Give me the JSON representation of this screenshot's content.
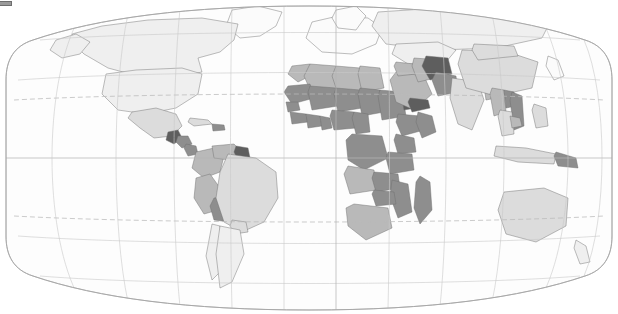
{
  "legend": {
    "swatch_color": "#9a9a9a",
    "label": "00",
    "label_note": "cropped numeric legend label at left edge"
  },
  "map": {
    "title": "",
    "projection": "robinson",
    "background_color": "#fdfdfd",
    "border_color": "#6d6d6d",
    "graticule": {
      "visible": true,
      "line_color": "#c9c9c9",
      "tropic_line_color": "#b9b9b9",
      "tropic_line_style": "dashed",
      "parallels": [
        "60N",
        "30N",
        "Tropic of Cancer",
        "Equator",
        "Tropic of Capricorn",
        "30S",
        "60S"
      ],
      "meridians": [
        "150W",
        "120W",
        "90W",
        "60W",
        "30W",
        "0",
        "30E",
        "60E",
        "90E",
        "120E",
        "150E"
      ]
    },
    "shade_scale": {
      "type": "sequential-grey",
      "levels": [
        {
          "name": "no-data",
          "color": "#fbfbfb"
        },
        {
          "name": "lowest",
          "color": "#efefef"
        },
        {
          "name": "low",
          "color": "#dcdcdc"
        },
        {
          "name": "medium",
          "color": "#b9b9b9"
        },
        {
          "name": "high",
          "color": "#8e8e8e"
        },
        {
          "name": "highest",
          "color": "#5e5e5e"
        }
      ]
    },
    "regions": [
      {
        "name": "canada",
        "level": "lowest"
      },
      {
        "name": "united-states",
        "level": "lowest"
      },
      {
        "name": "greenland",
        "level": "no-data"
      },
      {
        "name": "mexico",
        "level": "low"
      },
      {
        "name": "guatemala",
        "level": "highest"
      },
      {
        "name": "honduras",
        "level": "high"
      },
      {
        "name": "nicaragua",
        "level": "high"
      },
      {
        "name": "cuba",
        "level": "low"
      },
      {
        "name": "hispaniola",
        "level": "high"
      },
      {
        "name": "colombia",
        "level": "medium"
      },
      {
        "name": "venezuela",
        "level": "medium"
      },
      {
        "name": "guyana",
        "level": "highest"
      },
      {
        "name": "peru",
        "level": "medium"
      },
      {
        "name": "bolivia",
        "level": "high"
      },
      {
        "name": "brazil",
        "level": "low"
      },
      {
        "name": "paraguay",
        "level": "low"
      },
      {
        "name": "chile",
        "level": "lowest"
      },
      {
        "name": "argentina",
        "level": "lowest"
      },
      {
        "name": "europe",
        "level": "no-data"
      },
      {
        "name": "morocco",
        "level": "medium"
      },
      {
        "name": "algeria",
        "level": "medium"
      },
      {
        "name": "libya",
        "level": "medium"
      },
      {
        "name": "egypt",
        "level": "medium"
      },
      {
        "name": "mauritania",
        "level": "high"
      },
      {
        "name": "mali",
        "level": "high"
      },
      {
        "name": "niger",
        "level": "high"
      },
      {
        "name": "chad",
        "level": "high"
      },
      {
        "name": "sudan",
        "level": "high"
      },
      {
        "name": "eritrea",
        "level": "highest"
      },
      {
        "name": "ethiopia",
        "level": "high"
      },
      {
        "name": "somalia",
        "level": "high"
      },
      {
        "name": "senegal",
        "level": "high"
      },
      {
        "name": "guinea",
        "level": "high"
      },
      {
        "name": "ivory-coast",
        "level": "high"
      },
      {
        "name": "ghana",
        "level": "high"
      },
      {
        "name": "nigeria",
        "level": "high"
      },
      {
        "name": "cameroon",
        "level": "high"
      },
      {
        "name": "dr-congo",
        "level": "high"
      },
      {
        "name": "kenya",
        "level": "high"
      },
      {
        "name": "tanzania",
        "level": "high"
      },
      {
        "name": "angola",
        "level": "medium"
      },
      {
        "name": "zambia",
        "level": "high"
      },
      {
        "name": "mozambique",
        "level": "high"
      },
      {
        "name": "madagascar",
        "level": "high"
      },
      {
        "name": "zimbabwe",
        "level": "high"
      },
      {
        "name": "south-africa",
        "level": "medium"
      },
      {
        "name": "saudi-arabia",
        "level": "medium"
      },
      {
        "name": "yemen",
        "level": "highest"
      },
      {
        "name": "iraq",
        "level": "medium"
      },
      {
        "name": "iran",
        "level": "medium"
      },
      {
        "name": "afghanistan",
        "level": "highest"
      },
      {
        "name": "pakistan",
        "level": "high"
      },
      {
        "name": "india",
        "level": "low"
      },
      {
        "name": "nepal",
        "level": "medium"
      },
      {
        "name": "bangladesh",
        "level": "medium"
      },
      {
        "name": "china",
        "level": "low"
      },
      {
        "name": "mongolia",
        "level": "low"
      },
      {
        "name": "russia",
        "level": "lowest"
      },
      {
        "name": "kazakhstan",
        "level": "lowest"
      },
      {
        "name": "myanmar",
        "level": "medium"
      },
      {
        "name": "laos",
        "level": "high"
      },
      {
        "name": "vietnam",
        "level": "high"
      },
      {
        "name": "thailand",
        "level": "low"
      },
      {
        "name": "cambodia",
        "level": "medium"
      },
      {
        "name": "philippines",
        "level": "low"
      },
      {
        "name": "indonesia",
        "level": "low"
      },
      {
        "name": "papua-new-guinea",
        "level": "high"
      },
      {
        "name": "australia",
        "level": "low"
      },
      {
        "name": "new-zealand",
        "level": "lowest"
      },
      {
        "name": "japan",
        "level": "no-data"
      }
    ]
  }
}
